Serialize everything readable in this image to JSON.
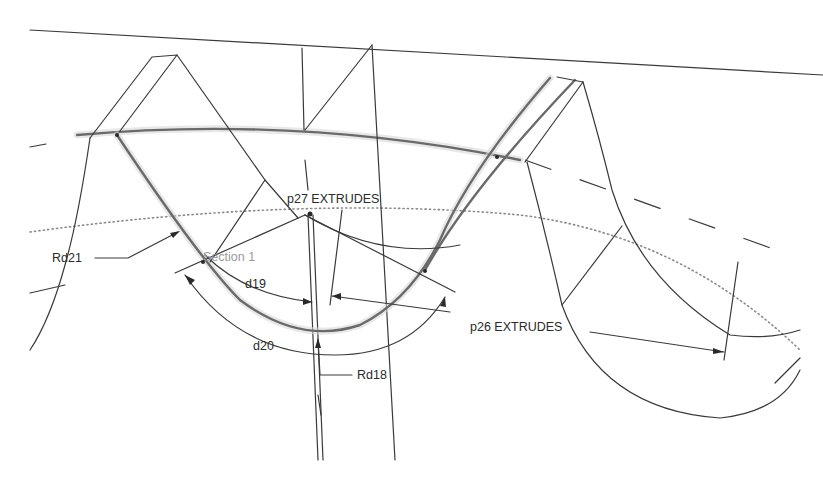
{
  "diagram": {
    "type": "cad-sketch",
    "labels": {
      "p27": "p27 EXTRUDES",
      "p26": "p26 EXTRUDES",
      "rd21": "Rd21",
      "rd18": "Rd18",
      "d19": "d19",
      "d20": "d20",
      "section": "Section 1"
    },
    "dimensions": [
      {
        "id": "Rd21",
        "kind": "radius"
      },
      {
        "id": "Rd18",
        "kind": "radius"
      },
      {
        "id": "d19",
        "kind": "angular"
      },
      {
        "id": "d20",
        "kind": "angular"
      }
    ],
    "features": [
      {
        "id": "p27",
        "kind": "extrude"
      },
      {
        "id": "p26",
        "kind": "extrude"
      }
    ],
    "colors": {
      "line": "#3a3a3a",
      "highlight": "#6a6a6a",
      "dotted": "#8a8a8a",
      "background": "#ffffff"
    }
  }
}
